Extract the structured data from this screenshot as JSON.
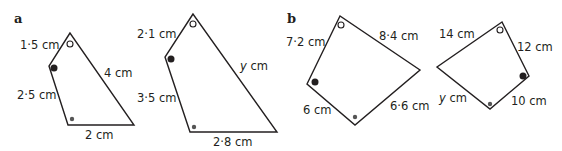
{
  "parts": [
    {
      "label": "a",
      "shapes": [
        {
          "sides": {
            "top_left": "1·5 cm",
            "left": "2·5 cm",
            "bottom": "2 cm",
            "right": "4 cm"
          }
        },
        {
          "sides": {
            "top_left": "2·1 cm",
            "left": "3·5 cm",
            "bottom": "2·8 cm",
            "right_var": "y",
            "right_unit": " cm"
          }
        }
      ]
    },
    {
      "label": "b",
      "shapes": [
        {
          "sides": {
            "top_left": "7·2 cm",
            "top_right": "8·4 cm",
            "bottom_left": "6 cm",
            "bottom_right": "6·6 cm"
          }
        },
        {
          "sides": {
            "top_left": "14 cm",
            "top_right": "12 cm",
            "bottom_left_var": "y",
            "bottom_left_unit": " cm",
            "bottom_right": "10 cm"
          }
        }
      ]
    }
  ],
  "angle_markers": [
    "open-circle",
    "filled-circle",
    "small-dot"
  ]
}
